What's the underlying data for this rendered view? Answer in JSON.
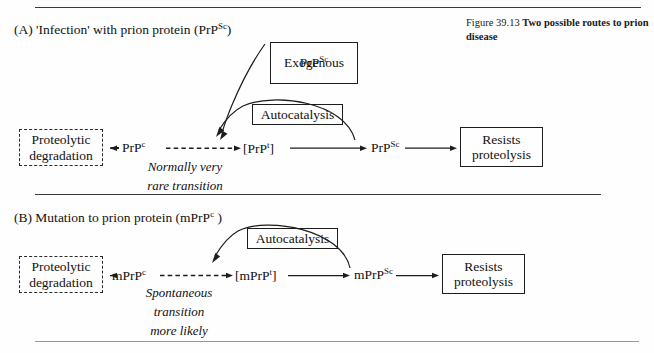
{
  "figure": {
    "caption_number": "Figure 39.13",
    "caption_title": "Two possible routes to prion disease"
  },
  "panels": [
    {
      "id": "A",
      "heading": "(A) 'Infection' with prion protein (PrP",
      "heading_sup": "Sc",
      "heading_tail": ")",
      "boxes": {
        "exogenous_line1": "Exogenous",
        "exogenous_line2_base": "PrP",
        "exogenous_line2_sup": "Sc",
        "autocatalysis": "Autocatalysis",
        "proteolytic_line1": "Proteolytic",
        "proteolytic_line2": "degradation",
        "resists_line1": "Resists",
        "resists_line2": "proteolysis"
      },
      "species": {
        "native_base": "PrP",
        "native_sup": "c",
        "intermediate": "[PrP",
        "intermediate_sup": "t",
        "intermediate_tail": "]",
        "scrapie_base": "PrP",
        "scrapie_sup": "Sc"
      },
      "annotation_lines": [
        "Normally very",
        "rare transition"
      ]
    },
    {
      "id": "B",
      "heading": "(B) Mutation to prion protein (mPrP",
      "heading_sup": "c",
      "heading_tail": " )",
      "boxes": {
        "autocatalysis": "Autocatalysis",
        "proteolytic_line1": "Proteolytic",
        "proteolytic_line2": "degradation",
        "resists_line1": "Resists",
        "resists_line2": "proteolysis"
      },
      "species": {
        "native_base": "mPrP",
        "native_sup": "c",
        "intermediate": "[mPrP",
        "intermediate_sup": "t",
        "intermediate_tail": "]",
        "scrapie_base": "mPrP",
        "scrapie_sup": "Sc"
      },
      "annotation_lines": [
        "Spontaneous",
        "transition",
        "more likely"
      ]
    }
  ]
}
